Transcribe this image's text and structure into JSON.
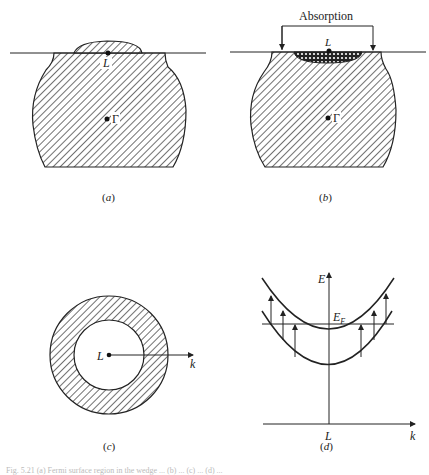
{
  "panels": {
    "a": {
      "label": "(a)",
      "points": {
        "L": "L",
        "Gamma": "Γ"
      }
    },
    "b": {
      "label": "(b)",
      "bracket_label": "Absorption",
      "points": {
        "L": "L",
        "Gamma": "Γ"
      }
    },
    "c": {
      "label": "(c)",
      "points": {
        "L": "L"
      },
      "axis": "k"
    },
    "d": {
      "label": "(d)",
      "axes": {
        "y": "E",
        "x": "k",
        "origin": "L"
      },
      "fermi_level": "E",
      "fermi_sub": "F"
    }
  },
  "caption": "Fig. 5.21  (a) Fermi surface region in the wedge ... (b) ... (c) ... (d) ..."
}
